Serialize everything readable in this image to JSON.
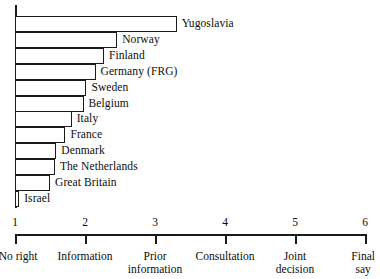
{
  "chart_data": {
    "type": "bar",
    "orientation": "horizontal",
    "title": "",
    "subtitle": "",
    "xlabel": "",
    "ylabel": "",
    "xlim": [
      1,
      6
    ],
    "grid": false,
    "legend": null,
    "categories": [
      "Yugoslavia",
      "Norway",
      "Finland",
      "Germany (FRG)",
      "Sweden",
      "Belgium",
      "Italy",
      "France",
      "Denmark",
      "The Netherlands",
      "Great Britain",
      "Israel"
    ],
    "values": [
      3.31,
      2.46,
      2.27,
      2.15,
      2.02,
      1.98,
      1.81,
      1.72,
      1.59,
      1.57,
      1.5,
      1.06
    ],
    "x_ticks": [
      1,
      2,
      3,
      4,
      5,
      6
    ],
    "x_tick_labels": [
      "1",
      "2",
      "3",
      "4",
      "5",
      "6"
    ],
    "x_tick_captions": [
      "No right",
      "Information",
      "Prior\ninformation",
      "Consultation",
      "Joint\ndecision",
      "Final\nsay"
    ]
  },
  "style": {
    "bar_fill": "#ffffff",
    "bar_stroke": "#1a1a1a",
    "axis_color": "#1a1a1a",
    "text_color": "#0d0d0d",
    "background": "#ffffff"
  }
}
